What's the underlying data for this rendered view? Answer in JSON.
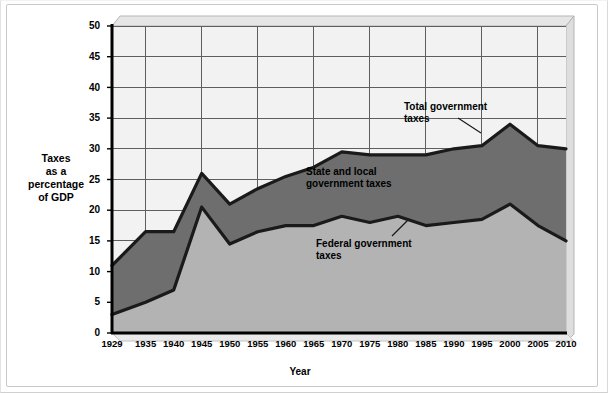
{
  "chart_data": {
    "type": "area",
    "title": "",
    "subtitle": "",
    "xlabel": "Year",
    "ylabel": "Taxes as a percentage of GDP",
    "ylabel_lines": [
      "Taxes",
      "as a",
      "percentage",
      "of GDP"
    ],
    "xlim": [
      1929,
      2010
    ],
    "ylim": [
      0,
      50
    ],
    "y_ticks": [
      0,
      5,
      10,
      15,
      20,
      25,
      30,
      35,
      40,
      45,
      50
    ],
    "x_ticks": [
      "1929",
      "1935",
      "1940",
      "1945",
      "1950",
      "1955",
      "1960",
      "1965",
      "1970",
      "1975",
      "1980",
      "1985",
      "1990",
      "1995",
      "2000",
      "2005",
      "2010"
    ],
    "x_values": [
      1929,
      1935,
      1940,
      1945,
      1950,
      1955,
      1960,
      1965,
      1970,
      1975,
      1980,
      1985,
      1990,
      1995,
      2000,
      2005,
      2010
    ],
    "grid": true,
    "grid_x_every": 2,
    "legend_position": "inline-annotations",
    "stacked": true,
    "series": [
      {
        "name": "Federal government taxes",
        "fill": "#b3b3b3",
        "stroke": "#1a1a1a",
        "values": [
          3,
          5,
          7,
          20.5,
          14.5,
          16.5,
          17.5,
          17.5,
          19,
          18,
          19,
          17.5,
          18,
          18.5,
          21,
          17.5,
          15
        ]
      },
      {
        "name": "State and local government taxes",
        "fill": "#6e6e6e",
        "stroke": "#1a1a1a",
        "values": [
          8,
          11.5,
          9.5,
          5.5,
          6.5,
          7,
          8,
          9.5,
          10.5,
          11,
          10,
          11.5,
          12,
          12,
          13,
          13,
          15
        ]
      }
    ],
    "total_series": {
      "name": "Total government taxes",
      "stroke": "#1a1a1a",
      "values": [
        11,
        16.5,
        16.5,
        26,
        21,
        23.5,
        25.5,
        27,
        29.5,
        29,
        29,
        29,
        30,
        30.5,
        34,
        30.5,
        30
      ]
    },
    "annotations": [
      {
        "id": "total",
        "text": "Total government\ntaxes",
        "label_line_1": "Total government",
        "label_line_2": "taxes"
      },
      {
        "id": "state",
        "text": "State and local\ngovernment taxes",
        "label_line_1": "State and local",
        "label_line_2": "government taxes"
      },
      {
        "id": "federal",
        "text": "Federal government\ntaxes",
        "label_line_1": "Federal government",
        "label_line_2": "taxes"
      }
    ],
    "colors": {
      "plot_background": "#f2f2f2",
      "federal_fill": "#b3b3b3",
      "state_local_fill": "#6e6e6e",
      "line": "#1a1a1a",
      "grid": "#666666",
      "frame": "#c9c9c9",
      "page_background": "#ffffff"
    }
  }
}
